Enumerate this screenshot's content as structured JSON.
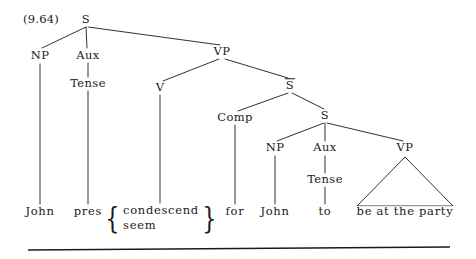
{
  "figure": {
    "example_number": "(9.64)",
    "type": "syntax-tree",
    "ink_color": "#1a1a1a",
    "background_color": "#ffffff"
  },
  "nodes": [
    {
      "id": "s-root",
      "label": "S",
      "x": 86,
      "y": 20,
      "overbar": false
    },
    {
      "id": "np-1",
      "label": "NP",
      "x": 40,
      "y": 56,
      "overbar": false
    },
    {
      "id": "aux-1",
      "label": "Aux",
      "x": 88,
      "y": 56,
      "overbar": false
    },
    {
      "id": "vp-1",
      "label": "VP",
      "x": 222,
      "y": 52,
      "overbar": false
    },
    {
      "id": "tense-1",
      "label": "Tense",
      "x": 88,
      "y": 84,
      "overbar": false
    },
    {
      "id": "v-1",
      "label": "V",
      "x": 160,
      "y": 88,
      "overbar": false
    },
    {
      "id": "sbar",
      "label": "S",
      "x": 290,
      "y": 86,
      "overbar": true
    },
    {
      "id": "comp",
      "label": "Comp",
      "x": 235,
      "y": 118,
      "overbar": false
    },
    {
      "id": "s-embedded",
      "label": "S",
      "x": 325,
      "y": 116,
      "overbar": false
    },
    {
      "id": "np-2",
      "label": "NP",
      "x": 275,
      "y": 148,
      "overbar": false
    },
    {
      "id": "aux-2",
      "label": "Aux",
      "x": 325,
      "y": 148,
      "overbar": false
    },
    {
      "id": "vp-2",
      "label": "VP",
      "x": 405,
      "y": 148,
      "overbar": false
    },
    {
      "id": "tense-2",
      "label": "Tense",
      "x": 325,
      "y": 180,
      "overbar": false
    }
  ],
  "leaves": [
    {
      "id": "leaf-john-1",
      "label": "John",
      "x": 40,
      "y": 212
    },
    {
      "id": "leaf-pres",
      "label": "pres",
      "x": 88,
      "y": 212
    },
    {
      "id": "leaf-for",
      "label": "for",
      "x": 235,
      "y": 212
    },
    {
      "id": "leaf-john-2",
      "label": "John",
      "x": 275,
      "y": 212
    },
    {
      "id": "leaf-to",
      "label": "to",
      "x": 325,
      "y": 212
    },
    {
      "id": "leaf-be-party",
      "label": "be at the party",
      "x": 405,
      "y": 212
    }
  ],
  "alternation": {
    "id": "leaf-verb-alternants",
    "x": 161,
    "y": 218,
    "open_brace": "{",
    "close_brace": "}",
    "options": [
      "condescend",
      "seem"
    ]
  },
  "edges": [
    {
      "from": "s-root",
      "to": "np-1",
      "x1": 86,
      "y1": 27,
      "x2": 42,
      "y2": 48
    },
    {
      "from": "s-root",
      "to": "aux-1",
      "x1": 86,
      "y1": 27,
      "x2": 87,
      "y2": 48
    },
    {
      "from": "s-root",
      "to": "vp-1",
      "x1": 88,
      "y1": 27,
      "x2": 220,
      "y2": 45
    },
    {
      "from": "aux-1",
      "to": "tense-1",
      "x1": 88,
      "y1": 63,
      "x2": 88,
      "y2": 77
    },
    {
      "from": "vp-1",
      "to": "v-1",
      "x1": 219,
      "y1": 59,
      "x2": 163,
      "y2": 81
    },
    {
      "from": "vp-1",
      "to": "sbar",
      "x1": 225,
      "y1": 59,
      "x2": 288,
      "y2": 78
    },
    {
      "from": "sbar",
      "to": "comp",
      "x1": 288,
      "y1": 93,
      "x2": 238,
      "y2": 111
    },
    {
      "from": "sbar",
      "to": "s-embedded",
      "x1": 292,
      "y1": 93,
      "x2": 324,
      "y2": 109
    },
    {
      "from": "s-embedded",
      "to": "np-2",
      "x1": 324,
      "y1": 123,
      "x2": 277,
      "y2": 141
    },
    {
      "from": "s-embedded",
      "to": "aux-2",
      "x1": 325,
      "y1": 123,
      "x2": 325,
      "y2": 141
    },
    {
      "from": "s-embedded",
      "to": "vp-2",
      "x1": 327,
      "y1": 123,
      "x2": 403,
      "y2": 141
    },
    {
      "from": "np-1",
      "to": "leaf-john-1",
      "x1": 40,
      "y1": 64,
      "x2": 40,
      "y2": 204
    },
    {
      "from": "tense-1",
      "to": "leaf-pres",
      "x1": 88,
      "y1": 91,
      "x2": 88,
      "y2": 204
    },
    {
      "from": "v-1",
      "to": "leaf-verb",
      "x1": 160,
      "y1": 95,
      "x2": 160,
      "y2": 203
    },
    {
      "from": "comp",
      "to": "leaf-for",
      "x1": 235,
      "y1": 125,
      "x2": 235,
      "y2": 204
    },
    {
      "from": "np-2",
      "to": "leaf-john-2",
      "x1": 275,
      "y1": 156,
      "x2": 275,
      "y2": 204
    },
    {
      "from": "tense-2",
      "to": "leaf-to",
      "x1": 325,
      "y1": 187,
      "x2": 325,
      "y2": 204
    },
    {
      "from": "aux-2",
      "to": "tense-2",
      "x1": 325,
      "y1": 156,
      "x2": 325,
      "y2": 173
    }
  ],
  "triangle": {
    "id": "vp-2-triangle",
    "apex_x": 405,
    "apex_y": 157,
    "left_x": 357,
    "left_y": 206,
    "right_x": 453,
    "right_y": 206
  },
  "rule": {
    "id": "bottom-rule",
    "x1": 28,
    "y1": 250,
    "x2": 450,
    "y2": 247
  }
}
